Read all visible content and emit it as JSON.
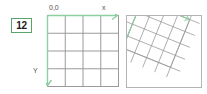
{
  "badge": {
    "label": "12"
  },
  "colors": {
    "accent_green": "#5aa469",
    "axis_green": "#8ccfa0",
    "grid_gray": "#9a9a9a",
    "panel_border": "#b4b4b4",
    "label_text": "#555555",
    "background": "#ffffff"
  },
  "left_panel": {
    "name": "unrotated-coordinate-grid",
    "origin_label": "0,0",
    "x_axis_label": "x",
    "y_axis_label": "Y",
    "grid_columns": 4,
    "grid_rows": 4
  },
  "right_panel": {
    "name": "rotated-coordinate-grid",
    "origin_label": "0,0",
    "x_axis_label": "x",
    "y_axis_label": "y",
    "grid_columns": 4,
    "grid_rows": 4,
    "rotation_degrees": 22
  }
}
